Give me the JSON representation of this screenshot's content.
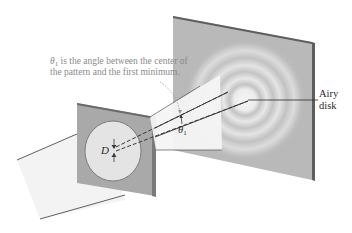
{
  "diagram": {
    "annotation": {
      "symbol": "θ",
      "subscript": "1",
      "line1_rest": " is the angle between the center of",
      "line2": "the pattern and the first minimum."
    },
    "airy_label": {
      "line1": "Airy",
      "line2": "disk"
    },
    "theta_label": {
      "symbol": "θ",
      "subscript": "1"
    },
    "aperture_label": "D",
    "colors": {
      "screen": "#b9b9b9",
      "screen_edge": "#5e5e5e",
      "plate": "#a9a9a9",
      "plate_edge": "#6a6a6a",
      "beam": "#f2f2f2",
      "ring_light": "#e6e6e6",
      "line": "#3a3a3a",
      "annotation_text": "#8a8a8a"
    }
  }
}
